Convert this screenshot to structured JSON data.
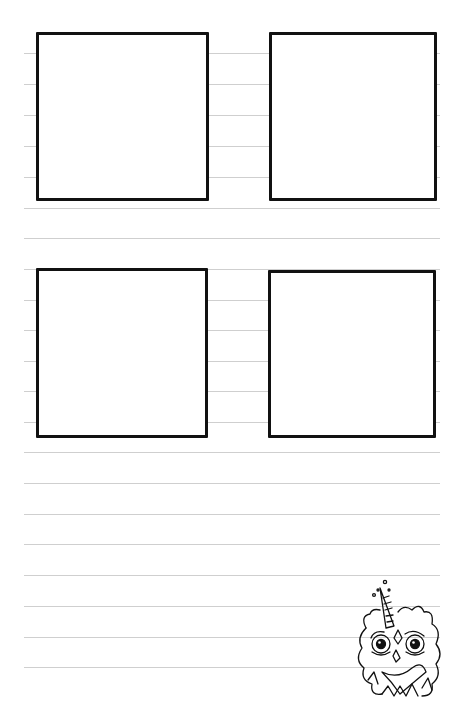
{
  "page": {
    "background": "#ffffff",
    "rule_color": "#cfcfcf",
    "panel_border_color": "#111111"
  },
  "rules_y": [
    53,
    84,
    115,
    146,
    177,
    208,
    238,
    269,
    300,
    330,
    361,
    391,
    422,
    452,
    483,
    514,
    544,
    575,
    606,
    637,
    667
  ],
  "panels": [
    {
      "name": "panel-top-left",
      "x": 36,
      "y": 32,
      "w": 173,
      "h": 169
    },
    {
      "name": "panel-top-right",
      "x": 269,
      "y": 32,
      "w": 168,
      "h": 169
    },
    {
      "name": "panel-bottom-left",
      "x": 36,
      "y": 268,
      "w": 172,
      "h": 170
    },
    {
      "name": "panel-bottom-right",
      "x": 268,
      "y": 270,
      "w": 168,
      "h": 168
    }
  ],
  "illustration": {
    "subject": "unicorn-owl-doodle"
  }
}
